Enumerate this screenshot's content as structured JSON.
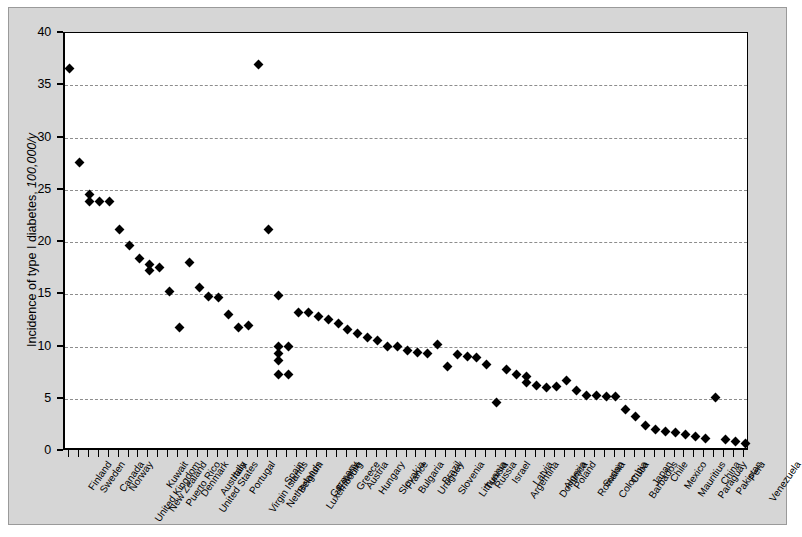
{
  "figure": {
    "background_color": "#d6d6d6",
    "plot_background_color": "#ffffff",
    "marker_color": "#000000",
    "grid_color": "#8d8d8d"
  },
  "axes": {
    "ylabel_prefix": "Incidence of type I diabetes, ",
    "ylabel_italic": "100,000/y",
    "ytick_labels": [
      "0",
      "5",
      "10",
      "15",
      "20",
      "25",
      "30",
      "35",
      "40"
    ]
  },
  "chart_data": {
    "type": "scatter",
    "title": "",
    "xlabel": "",
    "ylabel": "Incidence of type I diabetes, 100,000/y",
    "ylim": [
      0,
      40
    ],
    "ytick_values": [
      0,
      5,
      10,
      15,
      20,
      25,
      30,
      35,
      40
    ],
    "grid": true,
    "legend_position": "none",
    "categories": [
      "Finland",
      "Sweden",
      "Canada",
      "Norway",
      "United Kingdom",
      "New Zealand",
      "Kuwait",
      "Puerto Rico",
      "Denmark",
      "United States",
      "Australia",
      "Italy",
      "Portugal",
      "Virgin Islands",
      "Netherlands",
      "Spain",
      "Belgium",
      "Luxembourg",
      "Germany",
      "Estonia",
      "Greece",
      "Austria",
      "Hungary",
      "Slovakia",
      "France",
      "Bulgaria",
      "Uruguay",
      "Brazil",
      "Slovenia",
      "Lithuania",
      "Tunisia",
      "Russia",
      "Israel",
      "Argentina",
      "Latvia",
      "Dominica",
      "Algeria",
      "Poland",
      "Romania",
      "Sudan",
      "Colombia",
      "Cuba",
      "Barbados",
      "Japan",
      "Chile",
      "Mexico",
      "Mauritius",
      "Paraguay",
      "China",
      "Pakistan",
      "Peru",
      "Venezuela"
    ],
    "points": [
      {
        "category": "Finland",
        "values": [
          36.6
        ]
      },
      {
        "category": "Sweden",
        "values": [
          27.6
        ]
      },
      {
        "category": "Canada",
        "values": [
          24.5,
          24.0
        ]
      },
      {
        "category": "Norway",
        "values": [
          24.0
        ]
      },
      {
        "category": "United Kingdom",
        "values": [
          23.9
        ]
      },
      {
        "category": "New Zealand",
        "values": [
          21.2
        ]
      },
      {
        "category": "Kuwait",
        "values": [
          19.7
        ]
      },
      {
        "category": "Puerto Rico",
        "values": [
          18.4
        ]
      },
      {
        "category": "Denmark",
        "values": [
          17.8,
          17.3
        ]
      },
      {
        "category": "United States",
        "values": [
          17.5
        ]
      },
      {
        "category": "Australia",
        "values": [
          15.3
        ]
      },
      {
        "category": "Italy",
        "values": [
          14.7
        ]
      },
      {
        "category": "Portugal",
        "values": [
          13.1
        ]
      },
      {
        "category": "Virgin Islands",
        "values": [
          11.8
        ]
      },
      {
        "category": "Netherlands",
        "values": [
          18.0
        ]
      },
      {
        "category": "Spain",
        "values": [
          15.6
        ]
      },
      {
        "category": "Belgium",
        "values": [
          15.1
        ]
      },
      {
        "category": "Luxembourg",
        "values": [
          14.6
        ]
      },
      {
        "category": "Germany",
        "values": [
          11.8
        ]
      },
      {
        "category": "Estonia",
        "values": [
          11.9
        ]
      },
      {
        "category": "Greece",
        "values": [
          10.0,
          9.4,
          8.9,
          7.3
        ]
      },
      {
        "category": "Austria",
        "values": [
          37.0
        ]
      },
      {
        "category": "Hungary",
        "values": [
          21.2
        ]
      },
      {
        "category": "Slovakia",
        "values": [
          14.9
        ]
      },
      {
        "category": "France",
        "values": [
          10.0,
          7.3
        ]
      },
      {
        "category": "Bulgaria",
        "values": [
          13.3
        ]
      },
      {
        "category": "Uruguay",
        "values": [
          13.3
        ]
      },
      {
        "category": "Brazil",
        "values": [
          12.9
        ]
      },
      {
        "category": "Slovenia",
        "values": [
          12.2
        ]
      },
      {
        "category": "Lithuania",
        "values": [
          11.8
        ]
      },
      {
        "category": "Tunisia",
        "values": [
          11.4
        ]
      },
      {
        "category": "Russia",
        "values": [
          11.2
        ]
      },
      {
        "category": "Israel",
        "values": [
          10.9
        ]
      },
      {
        "category": "Argentina",
        "values": [
          10.1
        ]
      },
      {
        "category": "Latvia",
        "values": [
          10.0
        ]
      },
      {
        "category": "Dominica",
        "values": [
          9.6
        ]
      },
      {
        "category": "Algeria",
        "values": [
          9.3
        ]
      },
      {
        "category": "Poland",
        "values": [
          9.3
        ]
      },
      {
        "category": "Romania",
        "values": [
          10.2
        ]
      },
      {
        "category": "Sudan",
        "values": [
          8.2
        ]
      },
      {
        "category": "Colombia",
        "values": [
          9.2
        ]
      },
      {
        "category": "Cuba",
        "values": [
          9.0
        ]
      },
      {
        "category": "Barbados",
        "values": [
          8.9
        ]
      },
      {
        "category": "Japan",
        "values": [
          7.7
        ]
      },
      {
        "category": "Chile",
        "values": [
          9.6
        ]
      },
      {
        "category": "Mexico",
        "values": [
          7.9,
          6.1
        ]
      },
      {
        "category": "Mauritius",
        "values": [
          6.4
        ]
      },
      {
        "category": "Paraguay",
        "values": [
          6.2
        ]
      },
      {
        "category": "China",
        "values": [
          6.9,
          6.4,
          6.1
        ]
      },
      {
        "category": "Pakistan",
        "values": [
          7.2,
          6.1
        ]
      },
      {
        "category": "Peru",
        "values": [
          6.3
        ]
      },
      {
        "category": "Venezuela",
        "values": [
          5.9
        ]
      }
    ],
    "series_flat": {
      "x_index": [
        0,
        1,
        2,
        2,
        3,
        4,
        5,
        6,
        7,
        8,
        8,
        9,
        10,
        11,
        11,
        11,
        11,
        12,
        13,
        14,
        15,
        16,
        17,
        18,
        19,
        20,
        21,
        21,
        21,
        21,
        22,
        23,
        24,
        25,
        26,
        27,
        28,
        29,
        30,
        31,
        32,
        33,
        34,
        35,
        36,
        37,
        38,
        39,
        40,
        41,
        42,
        43,
        44,
        45,
        46,
        47,
        48,
        48,
        48,
        48,
        48,
        49,
        50,
        51
      ],
      "y_value": [
        36.6,
        27.6,
        24.5,
        24.0,
        24.0,
        23.9,
        21.2,
        19.7,
        18.4,
        17.8,
        17.3,
        17.5,
        15.3,
        14.7,
        10.0,
        9.4,
        7.3,
        13.1,
        11.8,
        37.0,
        11.8,
        11.9,
        10.0,
        7.3,
        13.3,
        13.3,
        12.9,
        12.2,
        11.8,
        11.4,
        11.2,
        10.9,
        10.1,
        10.0,
        9.6,
        9.3,
        9.3,
        10.2,
        8.2,
        9.2,
        9.0,
        8.9,
        7.7,
        9.6,
        7.9,
        6.1,
        6.4,
        6.2,
        6.9,
        6.4,
        6.1,
        5.1,
        1.2,
        0.7
      ]
    }
  },
  "plot_points": [
    {
      "cat": 0,
      "v": 36.6
    },
    {
      "cat": 1,
      "v": 27.6
    },
    {
      "cat": 2,
      "v": 24.5
    },
    {
      "cat": 2,
      "v": 23.9
    },
    {
      "cat": 3,
      "v": 23.9
    },
    {
      "cat": 4,
      "v": 23.9
    },
    {
      "cat": 5,
      "v": 21.2
    },
    {
      "cat": 6,
      "v": 19.7
    },
    {
      "cat": 7,
      "v": 18.4
    },
    {
      "cat": 8,
      "v": 17.8
    },
    {
      "cat": 8,
      "v": 17.3
    },
    {
      "cat": 9,
      "v": 17.6
    },
    {
      "cat": 10,
      "v": 15.3
    },
    {
      "cat": 11,
      "v": 11.8
    },
    {
      "cat": 12,
      "v": 18.0
    },
    {
      "cat": 13,
      "v": 15.6
    },
    {
      "cat": 14,
      "v": 14.8
    },
    {
      "cat": 15,
      "v": 14.7
    },
    {
      "cat": 16,
      "v": 13.1
    },
    {
      "cat": 17,
      "v": 11.8
    },
    {
      "cat": 18,
      "v": 12.0
    },
    {
      "cat": 19,
      "v": 37.0
    },
    {
      "cat": 20,
      "v": 21.2
    },
    {
      "cat": 21,
      "v": 14.9
    },
    {
      "cat": 21,
      "v": 10.0
    },
    {
      "cat": 21,
      "v": 9.3
    },
    {
      "cat": 21,
      "v": 8.7
    },
    {
      "cat": 21,
      "v": 7.3
    },
    {
      "cat": 22,
      "v": 10.0
    },
    {
      "cat": 22,
      "v": 7.3
    },
    {
      "cat": 23,
      "v": 13.3
    },
    {
      "cat": 24,
      "v": 13.3
    },
    {
      "cat": 25,
      "v": 12.9
    },
    {
      "cat": 26,
      "v": 12.6
    },
    {
      "cat": 27,
      "v": 12.2
    },
    {
      "cat": 28,
      "v": 11.6
    },
    {
      "cat": 29,
      "v": 11.2
    },
    {
      "cat": 30,
      "v": 10.9
    },
    {
      "cat": 31,
      "v": 10.6
    },
    {
      "cat": 32,
      "v": 10.0
    },
    {
      "cat": 33,
      "v": 10.0
    },
    {
      "cat": 34,
      "v": 9.6
    },
    {
      "cat": 35,
      "v": 9.4
    },
    {
      "cat": 36,
      "v": 9.3
    },
    {
      "cat": 37,
      "v": 10.2
    },
    {
      "cat": 38,
      "v": 8.1
    },
    {
      "cat": 39,
      "v": 9.2
    },
    {
      "cat": 40,
      "v": 9.0
    },
    {
      "cat": 41,
      "v": 8.9
    },
    {
      "cat": 42,
      "v": 8.3
    },
    {
      "cat": 43,
      "v": 4.6
    },
    {
      "cat": 44,
      "v": 7.8
    },
    {
      "cat": 45,
      "v": 7.3
    },
    {
      "cat": 46,
      "v": 7.1
    },
    {
      "cat": 46,
      "v": 6.6
    },
    {
      "cat": 47,
      "v": 6.3
    },
    {
      "cat": 48,
      "v": 6.1
    },
    {
      "cat": 49,
      "v": 6.2
    },
    {
      "cat": 50,
      "v": 6.7
    },
    {
      "cat": 51,
      "v": 5.8
    },
    {
      "cat": 52,
      "v": 5.3
    },
    {
      "cat": 53,
      "v": 5.3
    },
    {
      "cat": 54,
      "v": 5.2
    },
    {
      "cat": 55,
      "v": 5.2
    },
    {
      "cat": 56,
      "v": 4.0
    },
    {
      "cat": 57,
      "v": 3.3
    },
    {
      "cat": 58,
      "v": 2.4
    },
    {
      "cat": 59,
      "v": 2.1
    },
    {
      "cat": 60,
      "v": 1.9
    },
    {
      "cat": 61,
      "v": 1.8
    },
    {
      "cat": 62,
      "v": 1.6
    },
    {
      "cat": 63,
      "v": 1.4
    },
    {
      "cat": 64,
      "v": 1.2
    },
    {
      "cat": 65,
      "v": 5.1
    },
    {
      "cat": 66,
      "v": 1.1
    },
    {
      "cat": 67,
      "v": 0.9
    },
    {
      "cat": 68,
      "v": 0.7
    }
  ]
}
